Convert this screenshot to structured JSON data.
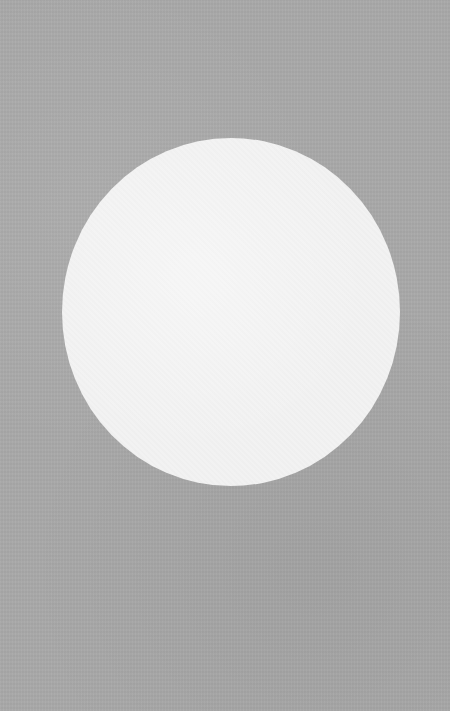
{
  "scene": {
    "background": {
      "color": "#a9a9a9",
      "texture": "paper-grain"
    },
    "shapes": [
      {
        "type": "circle",
        "color": "#f2f2f2",
        "center_x": 231,
        "center_y": 312,
        "width": 338,
        "height": 348
      }
    ]
  }
}
